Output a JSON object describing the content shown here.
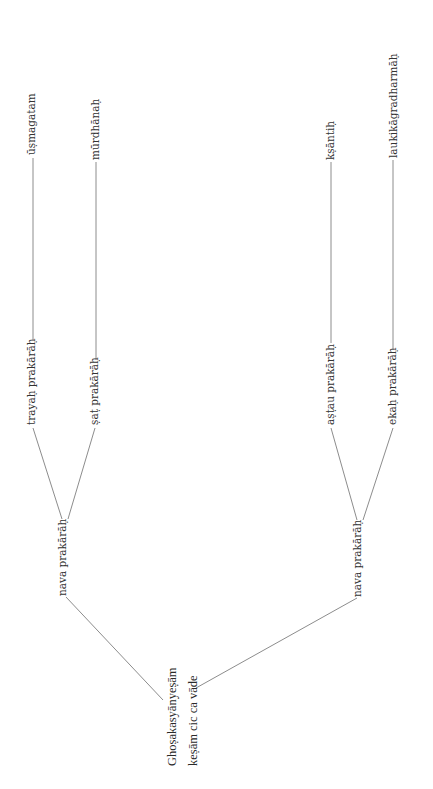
{
  "diagram": {
    "type": "tree",
    "orientation": "rotated-90-ccw",
    "root": {
      "line1": "Ghoṣakasyānyeṣām",
      "line2": "keṣām cic ca vāde"
    },
    "branches": [
      {
        "label": "nava prakārāḥ",
        "children": [
          {
            "label": "trayaḥ prakārāḥ",
            "leaf": "ūṣmagatam"
          },
          {
            "label": "ṣaṭ prakārāḥ",
            "leaf": "mūrdhānaḥ"
          }
        ]
      },
      {
        "label": "nava prakārāḥ",
        "children": [
          {
            "label": "aṣṭau prakārāḥ",
            "leaf": "kṣāntiḥ"
          },
          {
            "label": "ekaḥ prakārāḥ",
            "leaf": "laukikāgradharmāḥ"
          }
        ]
      }
    ]
  }
}
